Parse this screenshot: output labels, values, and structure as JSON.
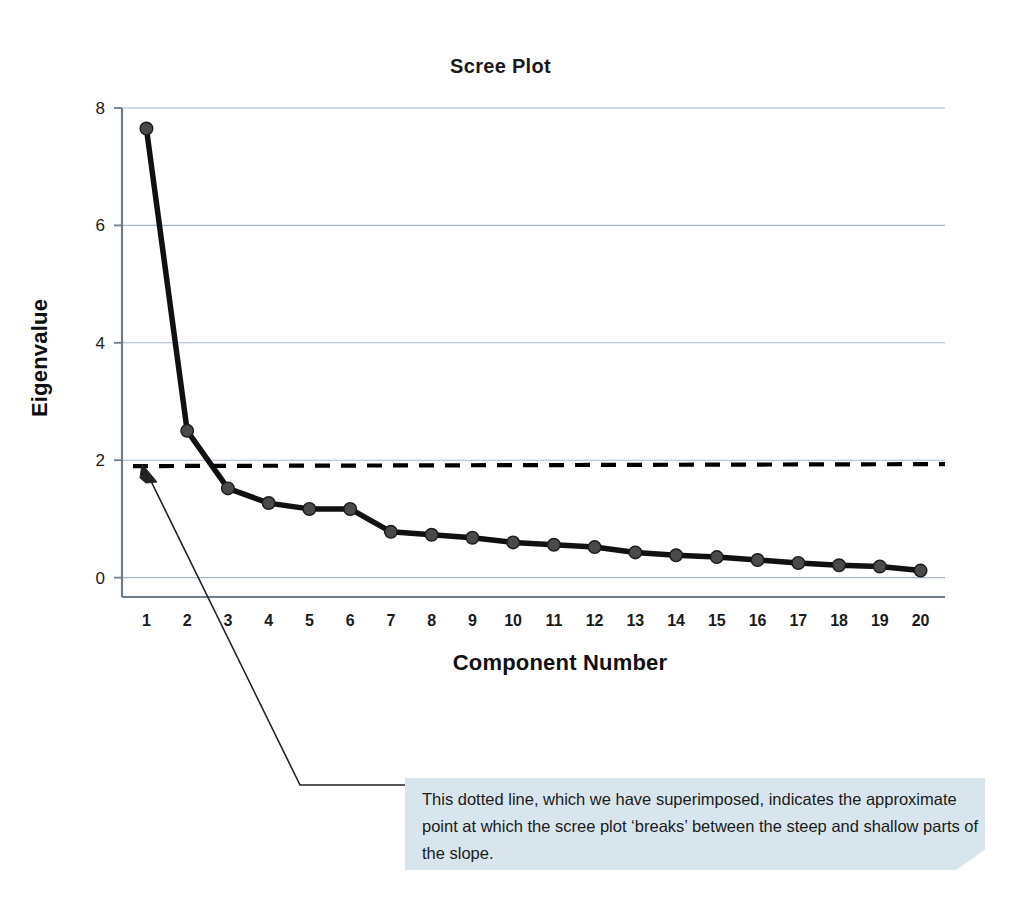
{
  "figure": {
    "title": "Scree Plot",
    "x_axis_label": "Component Number",
    "y_axis_label": "Eigenvalue"
  },
  "annotation": {
    "callout_text": "This dotted line, which we have superimposed, indicates the approximate point at which the scree plot ‘breaks’ between the steep and shallow parts of the slope.",
    "callout_background": "#d9e5ec",
    "leader_line_color": "#222222",
    "arrow_target_value": 1.9
  },
  "chart_data": {
    "type": "line",
    "title": "Scree Plot",
    "xlabel": "Component Number",
    "ylabel": "Eigenvalue",
    "x": [
      1,
      2,
      3,
      4,
      5,
      6,
      7,
      8,
      9,
      10,
      11,
      12,
      13,
      14,
      15,
      16,
      17,
      18,
      19,
      20
    ],
    "categories": [
      "1",
      "2",
      "3",
      "4",
      "5",
      "6",
      "7",
      "8",
      "9",
      "10",
      "11",
      "12",
      "13",
      "14",
      "15",
      "16",
      "17",
      "18",
      "19",
      "20"
    ],
    "values": [
      7.65,
      2.5,
      1.52,
      1.27,
      1.17,
      1.17,
      0.78,
      0.73,
      0.68,
      0.6,
      0.56,
      0.52,
      0.43,
      0.38,
      0.35,
      0.3,
      0.25,
      0.21,
      0.19,
      0.12
    ],
    "xlim": [
      0.4,
      20.6
    ],
    "ylim": [
      -0.33,
      8.0
    ],
    "yticks": [
      0,
      2,
      4,
      6,
      8
    ],
    "ytick_labels": [
      "0",
      "2",
      "4",
      "6",
      "8"
    ],
    "grid": true,
    "grid_color": "#aab8c6",
    "line_color": "#111111",
    "marker_color": "#4a4a4a",
    "marker": "circle",
    "legend": null,
    "annotations": [
      {
        "type": "hline",
        "value": 1.9,
        "style": "dashed",
        "color": "#000000",
        "label": "break point reference line"
      }
    ]
  }
}
